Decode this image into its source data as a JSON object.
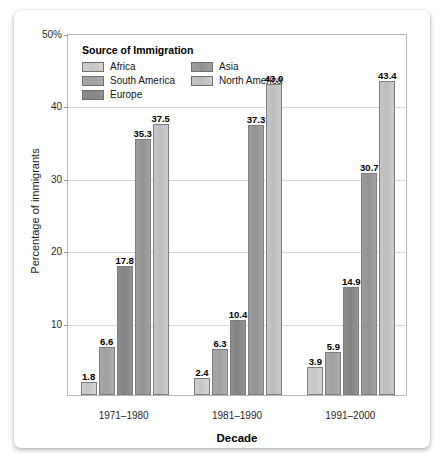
{
  "chart_data": {
    "type": "bar",
    "title": "",
    "legend_title": "Source of Immigration",
    "legend_position": "top-left inside plot",
    "xlabel": "Decade",
    "ylabel": "Percentage of immigrants",
    "categories": [
      "1971–1980",
      "1981–1990",
      "1991–2000"
    ],
    "ylim": [
      0,
      50
    ],
    "yticks": [
      10,
      20,
      30,
      40,
      50
    ],
    "ytick_labels": [
      "10",
      "20",
      "30",
      "40",
      "50%"
    ],
    "grid": true,
    "series": [
      {
        "name": "Africa",
        "color": "#cfcfcf",
        "values": [
          1.8,
          2.4,
          3.9
        ]
      },
      {
        "name": "South America",
        "color": "#a9a9a9",
        "values": [
          6.6,
          6.3,
          5.9
        ]
      },
      {
        "name": "Europe",
        "color": "#8d8d8d",
        "values": [
          17.8,
          10.4,
          14.9
        ]
      },
      {
        "name": "Asia",
        "color": "#9c9c9c",
        "values": [
          35.3,
          37.3,
          30.7
        ]
      },
      {
        "name": "North America",
        "color": "#c6c6c6",
        "values": [
          37.5,
          43.0,
          43.4
        ]
      }
    ],
    "data_labels": [
      [
        "1.8",
        "6.6",
        "17.8",
        "35.3",
        "37.5"
      ],
      [
        "2.4",
        "6.3",
        "10.4",
        "37.3",
        "43.0"
      ],
      [
        "3.9",
        "5.9",
        "14.9",
        "30.7",
        "43.4"
      ]
    ]
  }
}
